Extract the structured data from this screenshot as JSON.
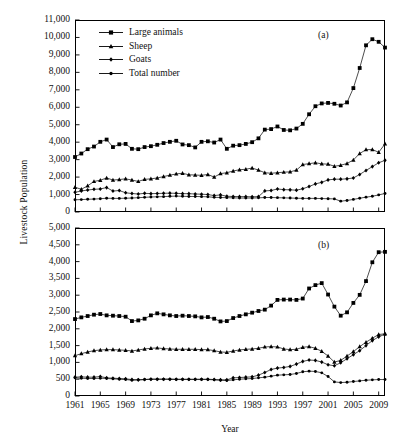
{
  "figure": {
    "ylabel": "Livestock Population",
    "xlabel": "Year",
    "panel_a_tag": "(a)",
    "panel_b_tag": "(b)"
  },
  "legend": {
    "position": "upper-left-panel-a",
    "items": [
      {
        "label": "Large animals",
        "marker": "square",
        "color": "#000000"
      },
      {
        "label": "Sheep",
        "marker": "triangle",
        "color": "#000000"
      },
      {
        "label": "Goats",
        "marker": "diamond",
        "color": "#000000"
      },
      {
        "label": "Total number",
        "marker": "circle",
        "color": "#000000"
      }
    ]
  },
  "chart_data": [
    {
      "id": "panel_a",
      "type": "line",
      "title": "(a)",
      "xlabel": "Year",
      "ylabel": "Livestock Population",
      "xlim": [
        1961,
        2010
      ],
      "ylim": [
        0,
        11000
      ],
      "ytick_step": 1000,
      "yticks": [
        0,
        1000,
        2000,
        3000,
        4000,
        5000,
        6000,
        7000,
        8000,
        9000,
        10000,
        11000
      ],
      "ytick_labels": [
        "0",
        "1,000",
        "2,000",
        "3,000",
        "4,000",
        "5,000",
        "6,000",
        "7,000",
        "8,000",
        "9,000",
        "10,000",
        "11,000"
      ],
      "xticks": [
        1961,
        1965,
        1969,
        1973,
        1977,
        1981,
        1985,
        1989,
        1993,
        1997,
        2001,
        2005,
        2009
      ],
      "xtick_labels": [
        "1961",
        "1965",
        "1969",
        "1973",
        "1977",
        "1981",
        "1985",
        "1989",
        "1993",
        "1997",
        "2001",
        "2005",
        "2009"
      ],
      "grid": false,
      "x": [
        1961,
        1962,
        1963,
        1964,
        1965,
        1966,
        1967,
        1968,
        1969,
        1970,
        1971,
        1972,
        1973,
        1974,
        1975,
        1976,
        1977,
        1978,
        1979,
        1980,
        1981,
        1982,
        1983,
        1984,
        1985,
        1986,
        1987,
        1988,
        1989,
        1990,
        1991,
        1992,
        1993,
        1994,
        1995,
        1996,
        1997,
        1998,
        1999,
        2000,
        2001,
        2002,
        2003,
        2004,
        2005,
        2006,
        2007,
        2008,
        2009,
        2010
      ],
      "series": [
        {
          "name": "Large animals",
          "marker": "square",
          "values": [
            3150,
            3350,
            3600,
            3750,
            4020,
            4150,
            3720,
            3880,
            3900,
            3620,
            3600,
            3720,
            3770,
            3850,
            3950,
            4020,
            4080,
            3870,
            3830,
            3700,
            4020,
            4050,
            3980,
            4150,
            3620,
            3800,
            3830,
            3900,
            4000,
            4220,
            4720,
            4750,
            4900,
            4700,
            4680,
            4780,
            5050,
            5600,
            6060,
            6220,
            6250,
            6200,
            6100,
            6280,
            7100,
            8250,
            9550,
            9900,
            9750,
            9420
          ]
        },
        {
          "name": "Sheep",
          "marker": "triangle",
          "values": [
            1420,
            1300,
            1500,
            1750,
            1820,
            1950,
            1830,
            1860,
            1900,
            1830,
            1750,
            1870,
            1900,
            1950,
            2030,
            2110,
            2180,
            2220,
            2130,
            2120,
            2100,
            2150,
            2000,
            2200,
            2250,
            2350,
            2420,
            2450,
            2520,
            2400,
            2250,
            2220,
            2250,
            2280,
            2300,
            2400,
            2720,
            2770,
            2820,
            2760,
            2740,
            2620,
            2680,
            2780,
            2980,
            3350,
            3570,
            3580,
            3420,
            3900
          ]
        },
        {
          "name": "Goats",
          "marker": "diamond",
          "values": [
            1130,
            1200,
            1260,
            1300,
            1320,
            1400,
            1200,
            1230,
            1100,
            1060,
            1030,
            1070,
            1050,
            1060,
            1070,
            1080,
            1070,
            1050,
            1050,
            1030,
            1020,
            1000,
            940,
            980,
            900,
            890,
            880,
            880,
            870,
            880,
            1210,
            1230,
            1320,
            1280,
            1270,
            1250,
            1330,
            1460,
            1610,
            1700,
            1840,
            1880,
            1880,
            1900,
            1950,
            2150,
            2380,
            2600,
            2820,
            2960
          ]
        },
        {
          "name": "Total number",
          "marker": "circle",
          "values": [
            700,
            710,
            730,
            740,
            760,
            790,
            780,
            780,
            790,
            800,
            820,
            840,
            860,
            870,
            880,
            900,
            910,
            900,
            890,
            890,
            880,
            870,
            840,
            830,
            820,
            810,
            800,
            800,
            800,
            810,
            830,
            830,
            820,
            810,
            800,
            790,
            780,
            780,
            780,
            770,
            760,
            750,
            620,
            660,
            720,
            790,
            850,
            900,
            980,
            1060
          ]
        }
      ]
    },
    {
      "id": "panel_b",
      "type": "line",
      "title": "(b)",
      "xlabel": "Year",
      "ylabel": "Livestock Population",
      "xlim": [
        1961,
        2010
      ],
      "ylim": [
        0,
        5000
      ],
      "ytick_step": 500,
      "yticks": [
        0,
        500,
        1000,
        1500,
        2000,
        2500,
        3000,
        3500,
        4000,
        4500,
        5000
      ],
      "ytick_labels": [
        "0",
        "500",
        "1,000",
        "1,500",
        "2,000",
        "2,500",
        "3,000",
        "3,500",
        "4,000",
        "4,500",
        "5,000"
      ],
      "xticks": [
        1961,
        1965,
        1969,
        1973,
        1977,
        1981,
        1985,
        1989,
        1993,
        1997,
        2001,
        2005,
        2009
      ],
      "xtick_labels": [
        "1961",
        "1965",
        "1969",
        "1973",
        "1977",
        "1981",
        "1985",
        "1989",
        "1993",
        "1997",
        "2001",
        "2005",
        "2009"
      ],
      "grid": false,
      "x": [
        1961,
        1962,
        1963,
        1964,
        1965,
        1966,
        1967,
        1968,
        1969,
        1970,
        1971,
        1972,
        1973,
        1974,
        1975,
        1976,
        1977,
        1978,
        1979,
        1980,
        1981,
        1982,
        1983,
        1984,
        1985,
        1986,
        1987,
        1988,
        1989,
        1990,
        1991,
        1992,
        1993,
        1994,
        1995,
        1996,
        1997,
        1998,
        1999,
        2000,
        2001,
        2002,
        2003,
        2004,
        2005,
        2006,
        2007,
        2008,
        2009,
        2010
      ],
      "series": [
        {
          "name": "Large animals",
          "marker": "square",
          "values": [
            2290,
            2340,
            2380,
            2420,
            2440,
            2400,
            2390,
            2380,
            2360,
            2230,
            2250,
            2300,
            2400,
            2460,
            2430,
            2400,
            2380,
            2390,
            2380,
            2370,
            2340,
            2350,
            2300,
            2220,
            2230,
            2320,
            2380,
            2430,
            2480,
            2530,
            2570,
            2690,
            2860,
            2870,
            2870,
            2860,
            2900,
            3200,
            3300,
            3360,
            3020,
            2660,
            2390,
            2490,
            2770,
            3010,
            3420,
            3980,
            4280,
            4290
          ]
        },
        {
          "name": "Sheep",
          "marker": "triangle",
          "values": [
            1200,
            1260,
            1310,
            1350,
            1370,
            1380,
            1380,
            1370,
            1360,
            1340,
            1370,
            1400,
            1420,
            1430,
            1410,
            1400,
            1390,
            1390,
            1390,
            1390,
            1380,
            1380,
            1350,
            1310,
            1300,
            1340,
            1370,
            1390,
            1400,
            1420,
            1460,
            1470,
            1460,
            1400,
            1380,
            1390,
            1450,
            1470,
            1420,
            1330,
            1190,
            1010,
            1060,
            1190,
            1320,
            1470,
            1600,
            1720,
            1830,
            1850
          ]
        },
        {
          "name": "Goats",
          "marker": "diamond",
          "values": [
            560,
            570,
            560,
            560,
            580,
            540,
            530,
            520,
            510,
            490,
            480,
            490,
            500,
            500,
            500,
            500,
            500,
            500,
            500,
            500,
            500,
            500,
            490,
            480,
            480,
            540,
            550,
            560,
            570,
            620,
            700,
            790,
            830,
            850,
            880,
            950,
            1030,
            1070,
            1060,
            1010,
            930,
            900,
            990,
            1110,
            1230,
            1350,
            1500,
            1650,
            1760,
            1840
          ]
        },
        {
          "name": "Total number",
          "marker": "circle",
          "values": [
            540,
            530,
            520,
            520,
            530,
            520,
            510,
            500,
            490,
            470,
            480,
            490,
            500,
            500,
            500,
            500,
            490,
            490,
            490,
            490,
            490,
            490,
            480,
            470,
            460,
            480,
            500,
            510,
            520,
            540,
            560,
            590,
            620,
            630,
            640,
            670,
            720,
            740,
            730,
            690,
            580,
            420,
            400,
            410,
            430,
            450,
            470,
            480,
            490,
            490
          ]
        }
      ]
    }
  ]
}
